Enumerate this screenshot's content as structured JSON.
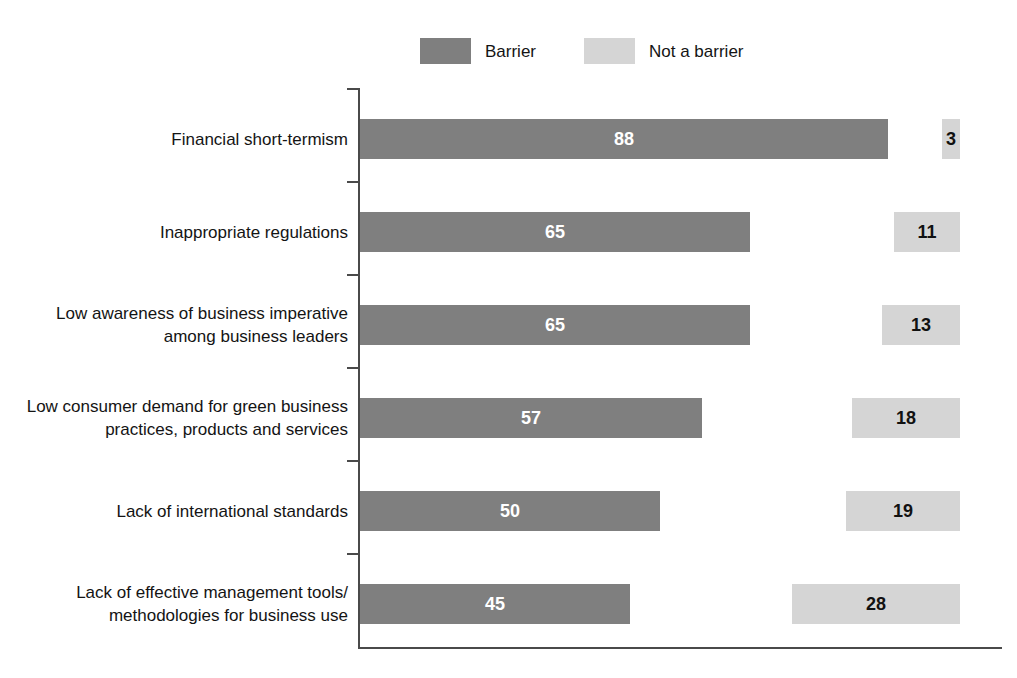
{
  "chart_data": {
    "type": "bar",
    "orientation": "horizontal",
    "title": "",
    "subtitle": "",
    "xlabel": "",
    "ylabel": "",
    "grid": false,
    "legend_position": "top-center",
    "xlim": [
      0,
      100
    ],
    "categories": [
      "Financial short-termism",
      "Inappropriate regulations",
      "Low awareness of business imperative among business leaders",
      "Low consumer demand for green business practices, products and services",
      "Lack of international standards",
      "Lack of effective management tools/methodologies for business use"
    ],
    "category_lines": [
      [
        "Financial short-termism"
      ],
      [
        "Inappropriate regulations"
      ],
      [
        "Low awareness of business imperative",
        "among business leaders"
      ],
      [
        "Low consumer demand for green business",
        "practices, products and services"
      ],
      [
        "Lack of international standards"
      ],
      [
        "Lack of effective management tools/",
        "methodologies for business use"
      ]
    ],
    "series": [
      {
        "name": "Barrier",
        "color": "#7f7f7f",
        "label_color": "#ffffff",
        "values": [
          88,
          65,
          65,
          57,
          50,
          45
        ]
      },
      {
        "name": "Not a barrier",
        "color": "#d5d5d5",
        "label_color": "#111111",
        "values": [
          3,
          11,
          13,
          18,
          19,
          28
        ]
      }
    ]
  },
  "legend": {
    "items": [
      {
        "label": "Barrier",
        "swatch": "dark"
      },
      {
        "label": "Not a barrier",
        "swatch": "light"
      }
    ]
  },
  "rows": [
    {
      "line1": "Financial short-termism",
      "line2": "",
      "barrier": "88",
      "not_barrier": "3"
    },
    {
      "line1": "Inappropriate regulations",
      "line2": "",
      "barrier": "65",
      "not_barrier": "11"
    },
    {
      "line1": "Low awareness of business imperative",
      "line2": "among business leaders",
      "barrier": "65",
      "not_barrier": "13"
    },
    {
      "line1": "Low consumer demand for green business",
      "line2": "practices, products and services",
      "barrier": "57",
      "not_barrier": "18"
    },
    {
      "line1": "Lack of international standards",
      "line2": "",
      "barrier": "50",
      "not_barrier": "19"
    },
    {
      "line1": "Lack of effective management tools/",
      "line2": "methodologies for business use",
      "barrier": "45",
      "not_barrier": "28"
    }
  ]
}
